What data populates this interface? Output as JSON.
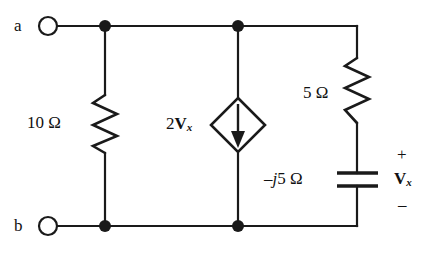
{
  "figure": {
    "type": "circuit-diagram",
    "background_color": "#ffffff",
    "line_color": "#1a1a1a",
    "width": 436,
    "height": 255
  },
  "terminals": [
    {
      "name": "terminal-a",
      "label": "a",
      "position": "top-left"
    },
    {
      "name": "terminal-b",
      "label": "b",
      "position": "bottom-left"
    }
  ],
  "components": {
    "resistor_left": {
      "label_value": "10",
      "label_unit": "Ω",
      "label_full": "10 Ω",
      "kind": "resistor"
    },
    "dependent_source": {
      "coefficient": "2",
      "variable": "V",
      "variable_subscript": "x",
      "label_full": "2Vx",
      "kind": "dependent-current-source",
      "arrow_direction": "down"
    },
    "resistor_right": {
      "label_value": "5",
      "label_unit": "Ω",
      "label_full": "5 Ω",
      "kind": "resistor"
    },
    "capacitor": {
      "label_sign": "–",
      "label_j": "j",
      "label_value": "5",
      "label_unit": "Ω",
      "label_full": "–j5 Ω",
      "kind": "capacitor"
    }
  },
  "voltage_label": {
    "plus": "+",
    "variable": "V",
    "variable_subscript": "x",
    "minus": "–"
  },
  "nodes": [
    {
      "name": "node-top-left",
      "x": 105,
      "y": 26
    },
    {
      "name": "node-top-mid",
      "x": 238,
      "y": 26
    },
    {
      "name": "node-bottom-left",
      "x": 105,
      "y": 226
    },
    {
      "name": "node-bottom-mid",
      "x": 238,
      "y": 226
    }
  ]
}
